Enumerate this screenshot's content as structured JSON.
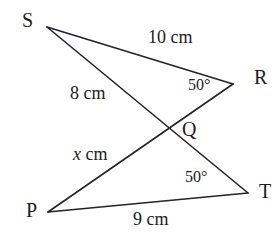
{
  "figure": {
    "type": "geometry-diagram",
    "width": 280,
    "height": 246,
    "background_color": "#ffffff",
    "stroke_color": "#232329",
    "text_color": "#1c1c22",
    "stroke_width": 1.6
  },
  "vertices": [
    {
      "id": "S",
      "label": "S",
      "x": 47,
      "y": 27,
      "label_x": 22,
      "label_y": 10
    },
    {
      "id": "R",
      "label": "R",
      "x": 233,
      "y": 84,
      "label_x": 254,
      "label_y": 67
    },
    {
      "id": "Q",
      "label": "Q",
      "x": 173,
      "y": 129,
      "label_x": 182,
      "label_y": 119
    },
    {
      "id": "P",
      "label": "P",
      "x": 48,
      "y": 212,
      "label_x": 26,
      "label_y": 200
    },
    {
      "id": "T",
      "label": "T",
      "x": 248,
      "y": 193,
      "label_x": 259,
      "label_y": 181
    }
  ],
  "segments": [
    {
      "id": "SR",
      "from": "S",
      "to": "R"
    },
    {
      "id": "ST",
      "from": "S",
      "to": "T"
    },
    {
      "id": "PR",
      "from": "P",
      "to": "R"
    },
    {
      "id": "PT",
      "from": "P",
      "to": "T"
    }
  ],
  "measures": [
    {
      "id": "SR-length",
      "text": "10 cm",
      "x": 148,
      "y": 28,
      "italic_first": false
    },
    {
      "id": "SQ-length",
      "text": "8 cm",
      "x": 70,
      "y": 84,
      "italic_first": false
    },
    {
      "id": "PQ-length",
      "text": "x cm",
      "x": 73,
      "y": 145,
      "italic_first": true,
      "italic_part": "x",
      "roman_part": " cm"
    },
    {
      "id": "PT-length",
      "text": "9 cm",
      "x": 133,
      "y": 210,
      "italic_first": false
    }
  ],
  "angles": [
    {
      "id": "angle-at-R",
      "text": "50°",
      "at_vertex": "R",
      "x": 188,
      "y": 77
    },
    {
      "id": "angle-at-T",
      "text": "50°",
      "at_vertex": "T",
      "x": 185,
      "y": 169
    }
  ]
}
